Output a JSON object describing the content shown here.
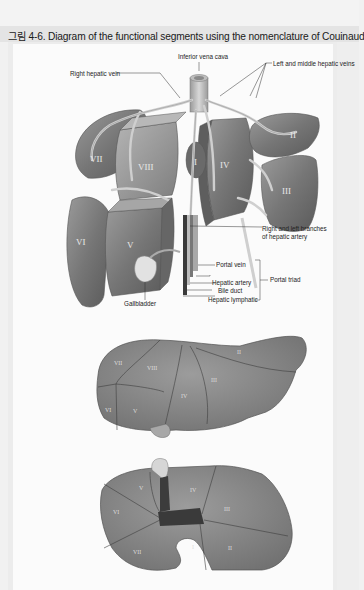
{
  "figure": {
    "title": "그림 4-6. Diagram of the functional segments using the nomenclature of Couinaud"
  },
  "top_diagram": {
    "labels": {
      "ivc": "Inferior vena cava",
      "left_middle_hv": "Left and middle hepatic veins",
      "right_hv": "Right hepatic vein",
      "hepatic_artery_branches_1": "Right and left branches",
      "hepatic_artery_branches_2": "of hepatic artery",
      "portal_vein": "Portal vein",
      "hepatic_artery": "Hepatic artery",
      "bile_duct": "Bile duct",
      "hepatic_lymphatic": "Hepatic lymphatic",
      "portal_triad": "Portal triad",
      "gallbladder": "Gallbladder"
    },
    "segments": {
      "s1": "I",
      "s2": "II",
      "s3": "III",
      "s4": "IV",
      "s5": "V",
      "s6": "VI",
      "s7": "VII",
      "s8": "VIII"
    }
  },
  "middle_diagram": {
    "segments": {
      "s2": "II",
      "s3": "III",
      "s4": "IV",
      "s5": "V",
      "s6": "VI",
      "s7": "VII",
      "s8": "VIII"
    }
  },
  "bottom_diagram": {
    "segments": {
      "s1": "I",
      "s2": "II",
      "s3": "III",
      "s4": "IV",
      "s5": "V",
      "s6": "VI",
      "s7": "VII"
    }
  }
}
